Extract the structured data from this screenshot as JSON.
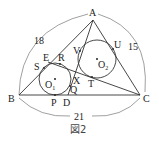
{
  "figure": {
    "caption": "図2",
    "vertices": {
      "A": {
        "label": "A",
        "x": 93,
        "y": 20
      },
      "B": {
        "label": "B",
        "x": 19,
        "y": 95
      },
      "C": {
        "label": "C",
        "x": 140,
        "y": 95
      }
    },
    "side_lengths": {
      "AB": "18",
      "AC": "15",
      "BC": "21"
    },
    "points": {
      "D": "D",
      "E": "E",
      "P": "P",
      "Q": "Q",
      "R": "R",
      "S": "S",
      "T": "T",
      "U": "U",
      "V": "V",
      "X": "X"
    },
    "circles": {
      "O1": {
        "label": "O",
        "sub": "1",
        "cx": 55,
        "cy": 79,
        "r": 16
      },
      "O2": {
        "label": "O",
        "sub": "2",
        "cx": 97,
        "cy": 59,
        "r": 19
      }
    }
  }
}
